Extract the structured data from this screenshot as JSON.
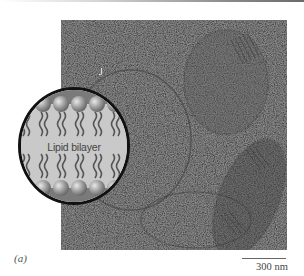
{
  "figure": {
    "panel_label": "(a)",
    "inset": {
      "label": "Lipid bilayer",
      "shape": "circle",
      "components": [
        "phospholipid-heads-top",
        "fatty-acid-tails",
        "phospholipid-heads-bottom"
      ]
    },
    "micrograph": {
      "description": "electron micrograph with grainy texture and circular/elongated vesicle outlines"
    },
    "scale_bar": {
      "label": "300 nm"
    },
    "colors": {
      "micrograph": "#4a4a4a",
      "inset_background": "#c9c9c9",
      "inset_border": "#111111",
      "lipid_head": "#9a9a9a",
      "lipid_tail": "#555555"
    }
  }
}
